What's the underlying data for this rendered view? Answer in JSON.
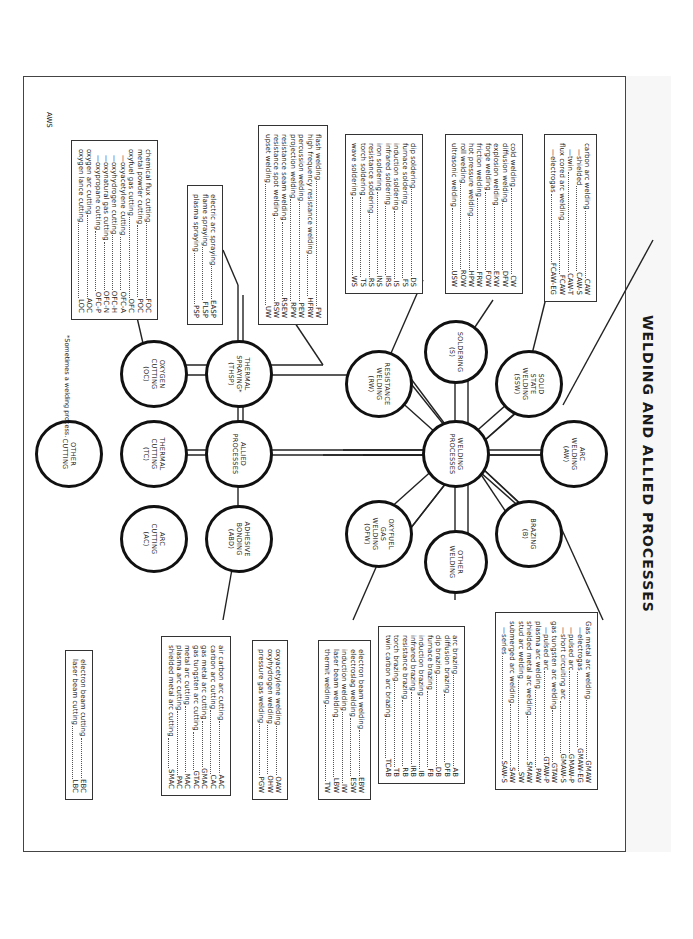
{
  "title": "WELDING AND ALLIED PROCESSES",
  "center_nodes": {
    "welding_processes": [
      "WELDING",
      "PROCESSES"
    ],
    "allied_processes": [
      "ALLIED",
      "PROCESSES"
    ],
    "thermal_cutting": [
      "THERMAL",
      "CUTTING",
      "(TC)"
    ]
  },
  "nodes": {
    "arc_welding": [
      "ARC",
      "WELDING",
      "(AW)"
    ],
    "solid_state_welding": [
      "SOLID",
      "STATE",
      "WELDING",
      "(SSW)"
    ],
    "soldering": [
      "SOLDERING",
      "(S)"
    ],
    "resistance_welding": [
      "RESISTANCE",
      "WELDING",
      "(RW)"
    ],
    "oxyfuel_gas_welding": [
      "OXYFUEL",
      "GAS",
      "WELDING",
      "(OFW)"
    ],
    "other_welding": [
      "OTHER",
      "WELDING"
    ],
    "brazing": [
      "BRAZING",
      "(B)"
    ],
    "thermal_spraying": [
      "THERMAL",
      "SPRAYING*",
      "(THSP)"
    ],
    "adhesive_bonding": [
      "ADHESIVE",
      "BONDING",
      "(ABD)"
    ],
    "oxygen_cutting": [
      "OXYGEN",
      "CUTTING",
      "(OC)"
    ],
    "arc_cutting": [
      "ARC",
      "CUTTING",
      "(AC)"
    ],
    "other_cutting": [
      "OTHER",
      "CUTTING"
    ]
  },
  "lists": {
    "arc_welding_a": [
      {
        "label": "carbon arc welding",
        "abbr": "CAW",
        "indent": 0
      },
      {
        "label": "—shielded",
        "abbr": "CAW-S",
        "indent": 1
      },
      {
        "label": "—twin",
        "abbr": "CAW-T",
        "indent": 1
      },
      {
        "label": "flux cored arc welding",
        "abbr": "FCAW",
        "indent": 0
      },
      {
        "label": "—electrogas",
        "abbr": "FCAW-EG",
        "indent": 1
      }
    ],
    "arc_welding_b": [
      {
        "label": "Gas metal arc welding",
        "abbr": "GMAW",
        "indent": 0
      },
      {
        "label": "—electrogas",
        "abbr": "GMAW-EG",
        "indent": 1
      },
      {
        "label": "—pulsed arc",
        "abbr": "GMAW-P",
        "indent": 1
      },
      {
        "label": "—short circuiting arc",
        "abbr": "GMAW-S",
        "indent": 1
      },
      {
        "label": "gas tungsten arc welding",
        "abbr": "GTAW",
        "indent": 0
      },
      {
        "label": "—pulsed arc",
        "abbr": "GTAW-P",
        "indent": 1
      },
      {
        "label": "plasma arc welding",
        "abbr": "PAW",
        "indent": 0
      },
      {
        "label": "shielded metal arc welding",
        "abbr": "SMAW",
        "indent": 0
      },
      {
        "label": "stud arc welding",
        "abbr": "SW",
        "indent": 0
      },
      {
        "label": "submerged arc welding",
        "abbr": "SAW",
        "indent": 0
      },
      {
        "label": "—series",
        "abbr": "SAW-S",
        "indent": 1
      }
    ],
    "solid_state": [
      {
        "label": "cold welding",
        "abbr": "CW",
        "indent": 0
      },
      {
        "label": "diffusion welding",
        "abbr": "DFW",
        "indent": 0
      },
      {
        "label": "explosion welding",
        "abbr": "EXW",
        "indent": 0
      },
      {
        "label": "forge welding",
        "abbr": "FOW",
        "indent": 0
      },
      {
        "label": "friction welding",
        "abbr": "FRW",
        "indent": 0
      },
      {
        "label": "hot pressure welding",
        "abbr": "HPW",
        "indent": 0
      },
      {
        "label": "roll welding",
        "abbr": "ROW",
        "indent": 0
      },
      {
        "label": "ultrasonic welding",
        "abbr": "USW",
        "indent": 0
      }
    ],
    "soldering": [
      {
        "label": "dip soldering",
        "abbr": "DS",
        "indent": 0
      },
      {
        "label": "furnace soldering",
        "abbr": "FS",
        "indent": 0
      },
      {
        "label": "induction soldering",
        "abbr": "IS",
        "indent": 0
      },
      {
        "label": "infrared soldering",
        "abbr": "IRS",
        "indent": 0
      },
      {
        "label": "iron soldering",
        "abbr": "INS",
        "indent": 0
      },
      {
        "label": "resistance soldering",
        "abbr": "RS",
        "indent": 0
      },
      {
        "label": "torch soldering",
        "abbr": "TS",
        "indent": 0
      },
      {
        "label": "wave soldering",
        "abbr": "WS",
        "indent": 0
      }
    ],
    "resistance": [
      {
        "label": "flash welding",
        "abbr": "FW",
        "indent": 0
      },
      {
        "label": "high frequency resistance welding",
        "abbr": "HFRW",
        "indent": 0
      },
      {
        "label": "percussion welding",
        "abbr": "PEW",
        "indent": 0
      },
      {
        "label": "projection welding",
        "abbr": "RPW",
        "indent": 0
      },
      {
        "label": "resistance seam welding",
        "abbr": "RSEW",
        "indent": 0
      },
      {
        "label": "resistance spot welding",
        "abbr": "RSW",
        "indent": 0
      },
      {
        "label": "upset welding",
        "abbr": "UW",
        "indent": 0
      }
    ],
    "thermal_spraying": [
      {
        "label": "electric arc spraying",
        "abbr": "EASP",
        "indent": 0
      },
      {
        "label": "flame spraying",
        "abbr": "FLSP",
        "indent": 0
      },
      {
        "label": "plasma spraying",
        "abbr": "PSP",
        "indent": 0
      }
    ],
    "oxygen_cutting": [
      {
        "label": "chemical flux cutting",
        "abbr": "FOC",
        "indent": 0
      },
      {
        "label": "metal powder cutting",
        "abbr": "POC",
        "indent": 0
      },
      {
        "label": "oxyfuel gas cutting",
        "abbr": "OFC",
        "indent": 0
      },
      {
        "label": "—oxyacetylene cutting",
        "abbr": "OFC-A",
        "indent": 1
      },
      {
        "label": "—oxyhydrogen cutting",
        "abbr": "OFC-H",
        "indent": 1
      },
      {
        "label": "—oxynatural gas cutting",
        "abbr": "OFC-N",
        "indent": 1
      },
      {
        "label": "—oxypropane cutting",
        "abbr": "OFC-P",
        "indent": 1
      },
      {
        "label": "oxygen arc cutting",
        "abbr": "AOC",
        "indent": 0
      },
      {
        "label": "oxygen lance cutting",
        "abbr": "LOC",
        "indent": 0
      }
    ],
    "brazing": [
      {
        "label": "arc brazing",
        "abbr": "AB",
        "indent": 0
      },
      {
        "label": "diffusion brazing",
        "abbr": "DFB",
        "indent": 0
      },
      {
        "label": "dip brazing",
        "abbr": "DB",
        "indent": 0
      },
      {
        "label": "furnace brazing",
        "abbr": "FB",
        "indent": 0
      },
      {
        "label": "induction brazing",
        "abbr": "IB",
        "indent": 0
      },
      {
        "label": "infrared brazing",
        "abbr": "IRB",
        "indent": 0
      },
      {
        "label": "resistance brazing",
        "abbr": "RB",
        "indent": 0
      },
      {
        "label": "torch brazing",
        "abbr": "TB",
        "indent": 0
      },
      {
        "label": "twin carbon arc brazing",
        "abbr": "TCAB",
        "indent": 0
      }
    ],
    "other_welding": [
      {
        "label": "electron beam welding",
        "abbr": "EBW",
        "indent": 0
      },
      {
        "label": "electroslag welding",
        "abbr": "ESW",
        "indent": 0
      },
      {
        "label": "induction welding",
        "abbr": "IW",
        "indent": 0
      },
      {
        "label": "laser beam welding",
        "abbr": "LBW",
        "indent": 0
      },
      {
        "label": "thermit welding",
        "abbr": "TW",
        "indent": 0
      }
    ],
    "oxyfuel": [
      {
        "label": "oxyacetylene welding",
        "abbr": "OAW",
        "indent": 0
      },
      {
        "label": "oxyhydrogen welding",
        "abbr": "OHW",
        "indent": 0
      },
      {
        "label": "pressure gas welding",
        "abbr": "PGW",
        "indent": 0
      }
    ],
    "arc_cutting": [
      {
        "label": "air carbon arc cutting",
        "abbr": "AAC",
        "indent": 0
      },
      {
        "label": "carbon arc cutting",
        "abbr": "CAC",
        "indent": 0
      },
      {
        "label": "gas metal arc cutting",
        "abbr": "GMAC",
        "indent": 0
      },
      {
        "label": "gas tungsten arc cutting",
        "abbr": "GTAC",
        "indent": 0
      },
      {
        "label": "metal arc cutting",
        "abbr": "MAC",
        "indent": 0
      },
      {
        "label": "plasma arc cutting",
        "abbr": "PAC",
        "indent": 0
      },
      {
        "label": "shielded metal arc cutting",
        "abbr": "SMAC",
        "indent": 0
      }
    ],
    "other_cutting": [
      {
        "label": "electron beam cutting",
        "abbr": "EBC",
        "indent": 0
      },
      {
        "label": "laser beam cutting",
        "abbr": "LBC",
        "indent": 0
      }
    ]
  },
  "footnote": "*Sometimes a welding process.",
  "source": "AWS"
}
